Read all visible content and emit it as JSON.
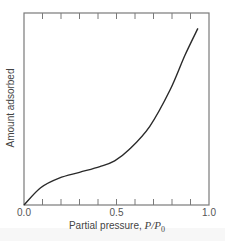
{
  "chart_data": {
    "type": "line",
    "title": "",
    "xlabel": "Partial pressure, P/P0",
    "xlabel_parts": {
      "text": "Partial pressure, ",
      "var": "P/P",
      "sub": "0"
    },
    "ylabel": "Amount adsorbed",
    "xlim": [
      0.0,
      1.0
    ],
    "ylim": [
      0,
      1
    ],
    "x_tick_labels": [
      "0.0",
      "0.5",
      "1.0"
    ],
    "x_ticks_minor_step": 0.1,
    "top_ticks": true,
    "grid": false,
    "legend": null,
    "series": [
      {
        "name": "Type II adsorption isotherm",
        "color": "#2a2a2a",
        "x": [
          0.0,
          0.09,
          0.19,
          0.3,
          0.41,
          0.49,
          0.57,
          0.68,
          0.79,
          0.87,
          0.94
        ],
        "y": [
          0.0,
          0.09,
          0.14,
          0.17,
          0.2,
          0.23,
          0.29,
          0.41,
          0.6,
          0.78,
          0.92
        ]
      }
    ]
  },
  "colors": {
    "frame": "#7a7a7a",
    "curve": "#2a2a2a",
    "text": "#555555"
  }
}
